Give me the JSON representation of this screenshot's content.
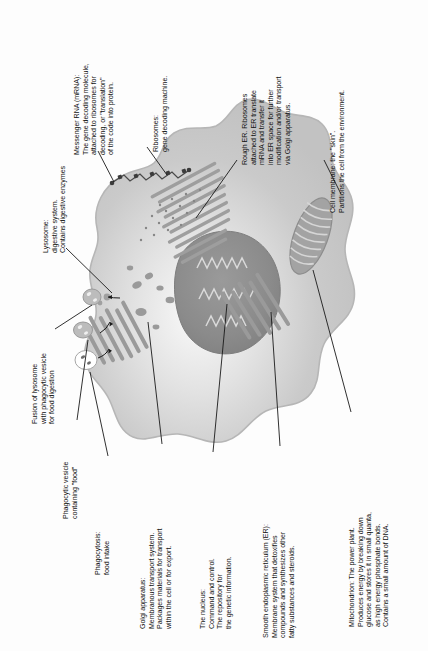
{
  "diagram": {
    "orientation": "labels rotated 90 degrees counter-clockwise",
    "colors": {
      "cytoplasm": "#c9c9c9",
      "cytoplasm_light": "#ededed",
      "nucleus": "#8f8f8f",
      "organelle": "#9a9a9a",
      "membrane_outline": "#b4b4b4",
      "text": "#111111",
      "leader_line": "#1a1a1a",
      "background": "#ffffff"
    }
  },
  "labels": [
    {
      "id": "mrna",
      "name": "messenger-rna",
      "lines": [
        "Messenger RNA (mRNA):",
        "The gene decoding molecule,",
        "attached to ribosomes for",
        "decoding, or \"translation\"",
        "of the code into protein."
      ]
    },
    {
      "id": "ribosomes",
      "name": "ribosomes",
      "lines": [
        "Ribosomes:",
        "gene decoding machine."
      ]
    },
    {
      "id": "rough-er",
      "name": "rough-endoplasmic-reticulum",
      "lines": [
        "Rough ER. Ribosomes",
        "attached to ER translate",
        "mRNA and transfer it",
        "into ER space for further",
        "modification and/or transport",
        "via Golgi apparatus."
      ]
    },
    {
      "id": "cell-membrane",
      "name": "cell-membrane",
      "lines": [
        "Cell membrane: the \"skin\".",
        "Partitions the cell from the environment."
      ]
    },
    {
      "id": "lysosome",
      "name": "lysosome",
      "lines": [
        "Lysosome:",
        "digestive system.",
        "Contains digestive enzymes"
      ]
    },
    {
      "id": "fusion",
      "name": "lysosome-vesicle-fusion",
      "lines": [
        "Fusion of lysosome",
        "with phagocytic vesicle",
        "for food digestion"
      ]
    },
    {
      "id": "phagocytic-vesicle",
      "name": "phagocytic-vesicle",
      "lines": [
        "Phagocytic vesicle",
        "containing \"food\""
      ]
    },
    {
      "id": "phagocytosis",
      "name": "phagocytosis",
      "lines": [
        "Phagocytosis:",
        "food intake"
      ]
    },
    {
      "id": "golgi",
      "name": "golgi-apparatus",
      "lines": [
        "Golgi apparatus:",
        "Membranous transport system.",
        "Packages materials for transport",
        "within the cell or for export."
      ]
    },
    {
      "id": "nucleus",
      "name": "nucleus",
      "lines": [
        "The nucleus:",
        "Command and control.",
        "The repository for",
        "the genetic information."
      ]
    },
    {
      "id": "smooth-er",
      "name": "smooth-endoplasmic-reticulum",
      "lines": [
        "Smooth endoplasmic reticulum (ER):",
        "Membrane system that detoxifies",
        "compounds and synthesizes other",
        "fatty substances and steroids."
      ]
    },
    {
      "id": "mitochondrion",
      "name": "mitochondrion",
      "lines": [
        "Mitochondrion: The power plant.",
        "Produces energy by breaking down",
        "glucose and stores it in small quanta,",
        "as high energy phosphate bonds.",
        "Contains a small amount of DNA."
      ]
    }
  ],
  "label_text": {
    "mrna": "Messenger RNA (mRNA):\nThe gene decoding molecule,\nattached to ribosomes for\ndecoding, or \"translation\"\nof the code into protein.",
    "ribosomes": "Ribosomes:\ngene decoding machine.",
    "rough_er": "Rough ER. Ribosomes\nattached to ER translate\nmRNA and transfer it\ninto ER space for further\nmodification and/or transport\nvia Golgi apparatus.",
    "cell_membrane": "Cell membrane: the \"skin\".\nPartitions the cell from the environment.",
    "lysosome": "Lysosome:\ndigestive system.\nContains digestive enzymes",
    "fusion": "Fusion of lysosome\nwith phagocytic vesicle\nfor food digestion",
    "phagocytic_vesicle": "Phagocytic vesicle\ncontaining \"food\"",
    "phagocytosis": "Phagocytosis:\nfood intake",
    "golgi": "Golgi apparatus:\nMembranous transport system.\nPackages materials for transport\nwithin the cell or for export.",
    "nucleus": "The nucleus:\nCommand and control.\nThe repository for\nthe genetic information.",
    "smooth_er": "Smooth endoplasmic reticulum (ER):\nMembrane system that detoxifies\ncompounds and synthesizes other\nfatty substances and steroids.",
    "mitochondrion": "Mitochondrion: The power plant.\nProduces energy by breaking down\nglucose and stores it in small quanta,\nas high energy phosphate bonds.\nContains a small amount of DNA."
  },
  "organelles": [
    {
      "name": "cell-membrane-outline"
    },
    {
      "name": "cytoplasm"
    },
    {
      "name": "nucleus-body"
    },
    {
      "name": "nucleolus-chromatin"
    },
    {
      "name": "rough-er-stacks"
    },
    {
      "name": "smooth-er-stacks"
    },
    {
      "name": "golgi-stacks"
    },
    {
      "name": "mitochondrion-body"
    },
    {
      "name": "mrna-strand"
    },
    {
      "name": "lysosome-vesicle"
    },
    {
      "name": "phagocytic-vesicle-body"
    },
    {
      "name": "phagocytosis-pocket"
    }
  ]
}
